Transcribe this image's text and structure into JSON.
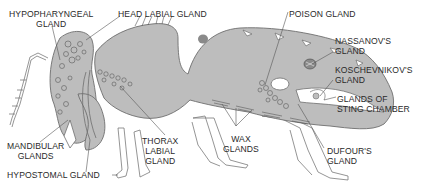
{
  "diagram": {
    "colors": {
      "body_fill": "#bdbdbd",
      "outline": "#6e6e6e",
      "leader_line": "#555555",
      "poison_spot": "#8a8a8a",
      "background": "#ffffff"
    },
    "labels": {
      "hypopharyngeal": [
        "HYPOPHARYNGEAL",
        "GLAND"
      ],
      "head_labial": "HEAD LABIAL GLAND",
      "poison": "POISON GLAND",
      "nassanov": [
        "NASSANOV'S",
        "GLAND"
      ],
      "koschevnikov": [
        "KOSCHEVNIKOV'S",
        "GLAND"
      ],
      "sting_chamber": [
        "GLANDS OF",
        "STING CHAMBER"
      ],
      "mandibular": [
        "MANDIBULAR",
        "GLANDS"
      ],
      "thorax_labial": [
        "THORAX",
        "LABIAL",
        "GLAND"
      ],
      "wax": [
        "WAX",
        "GLANDS"
      ],
      "dufour": [
        "DUFOUR'S",
        "GLAND"
      ],
      "hypostomal": "HYPOSTOMAL GLAND"
    }
  }
}
